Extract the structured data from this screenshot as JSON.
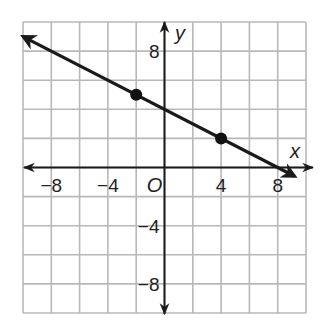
{
  "chart_data": {
    "type": "line",
    "title": "",
    "xlabel": "x",
    "ylabel": "y",
    "origin_label": "O",
    "xlim": [
      -10,
      10
    ],
    "ylim": [
      -10,
      10
    ],
    "grid": true,
    "grid_step": 2,
    "x_ticks": [
      -8,
      -4,
      4,
      8
    ],
    "y_ticks": [
      8,
      -4,
      -8
    ],
    "x_tick_labels": [
      "−8",
      "−4",
      "4",
      "8"
    ],
    "y_tick_labels": [
      "8",
      "−4",
      "−8"
    ],
    "line": {
      "equation": "y = -0.5x + 4",
      "slope": -0.5,
      "y_intercept": 4,
      "x_intercept": 8,
      "arrows_both_ends": true
    },
    "points": [
      {
        "x": -2,
        "y": 5
      },
      {
        "x": 4,
        "y": 2
      }
    ],
    "colors": {
      "grid": "#b8b8b8",
      "axes": "#1a1a1a",
      "line": "#1a1a1a",
      "points": "#111111"
    }
  }
}
